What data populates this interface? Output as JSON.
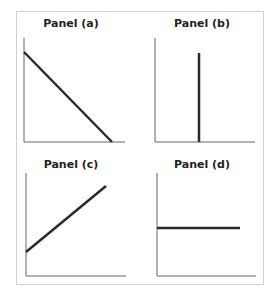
{
  "panels": [
    {
      "id": "a",
      "title": "Panel (a)",
      "shape": "downward-sloping line"
    },
    {
      "id": "b",
      "title": "Panel (b)",
      "shape": "vertical line"
    },
    {
      "id": "c",
      "title": "Panel (c)",
      "shape": "upward-sloping line with positive intercept"
    },
    {
      "id": "d",
      "title": "Panel (d)",
      "shape": "horizontal line"
    }
  ],
  "colors": {
    "axis": "#555555",
    "line": "#2b2b2b",
    "frame": "#cfcfcf"
  }
}
